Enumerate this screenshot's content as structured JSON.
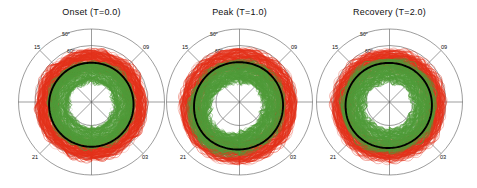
{
  "figure": {
    "background": "#ffffff",
    "panel_count": 3
  },
  "chart_data": {
    "type": "line",
    "projection": "polar-magnetic-latitude-MLT",
    "grid": true,
    "legend_position": "none",
    "colors": {
      "red_traces": "#e3311a",
      "green_traces": "#4f9b39",
      "mean_line": "#000000",
      "grid": "#5a5a5a",
      "background": "#ffffff"
    },
    "radial_axis": {
      "label": "Magnetic latitude",
      "tick_labels": [
        "50°",
        "60°",
        "70°"
      ],
      "tick_values": [
        50,
        60,
        70
      ],
      "range": [
        90,
        45
      ],
      "direction": "decreasing-outward"
    },
    "angular_axis": {
      "label": "Magnetic local time (MLT)",
      "tick_labels": [
        "15",
        "09",
        "21",
        "03"
      ],
      "tick_values": [
        15,
        9,
        21,
        3
      ],
      "spoke_count": 8
    },
    "series_description": [
      {
        "name": "Equatorward boundary ensemble",
        "color": "#e3311a",
        "style": "thin scattered traces"
      },
      {
        "name": "Poleward boundary ensemble",
        "color": "#4f9b39",
        "style": "thin scattered traces"
      },
      {
        "name": "Mean equatorward boundary",
        "color": "#000000",
        "style": "thick solid line"
      }
    ],
    "panels": [
      {
        "title": "Onset (T=0.0)",
        "phase": "Onset",
        "T": 0.0,
        "mean_boundary_latitude_by_mlt": {
          "00": 65.5,
          "03": 66.0,
          "06": 67.0,
          "09": 68.0,
          "12": 68.5,
          "15": 68.0,
          "18": 66.8,
          "21": 65.8
        },
        "red_spread_latitude": [
          60.0,
          70.5
        ],
        "green_spread_latitude": [
          67.0,
          77.0
        ]
      },
      {
        "title": "Peak (T=1.0)",
        "phase": "Peak",
        "T": 1.0,
        "mean_boundary_latitude_by_mlt": {
          "00": 64.0,
          "03": 64.8,
          "06": 66.2,
          "09": 67.5,
          "12": 68.2,
          "15": 67.2,
          "18": 65.2,
          "21": 63.5
        },
        "red_spread_latitude": [
          58.5,
          70.0
        ],
        "green_spread_latitude": [
          65.0,
          76.0
        ]
      },
      {
        "title": "Recovery (T=2.0)",
        "phase": "Recovery",
        "T": 2.0,
        "mean_boundary_latitude_by_mlt": {
          "00": 64.8,
          "03": 65.5,
          "06": 66.8,
          "09": 68.0,
          "12": 68.6,
          "15": 67.6,
          "18": 66.0,
          "21": 64.6
        },
        "red_spread_latitude": [
          59.0,
          70.5
        ],
        "green_spread_latitude": [
          64.5,
          77.0
        ]
      }
    ]
  },
  "panels": [
    {
      "title": "Onset (T=0.0)",
      "lat_labels": [
        "50°",
        "60°",
        "70°"
      ],
      "mlt_labels": {
        "upper_left": "15",
        "upper_right": "09",
        "lower_left": "21",
        "lower_right": "03"
      }
    },
    {
      "title": "Peak (T=1.0)",
      "lat_labels": [
        "50°",
        "60°",
        "70°"
      ],
      "mlt_labels": {
        "upper_left": "15",
        "upper_right": "09",
        "lower_left": "21",
        "lower_right": "03"
      }
    },
    {
      "title": "Recovery (T=2.0)",
      "lat_labels": [
        "50°",
        "60°",
        "70°"
      ],
      "mlt_labels": {
        "upper_left": "15",
        "upper_right": "09",
        "lower_left": "21",
        "lower_right": "03"
      }
    }
  ]
}
